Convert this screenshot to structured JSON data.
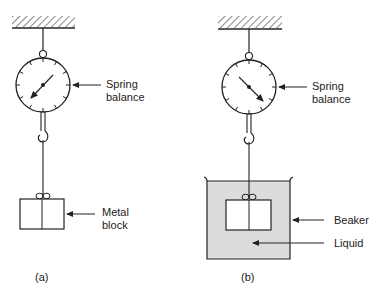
{
  "figure": {
    "panels": [
      {
        "id": "a",
        "caption": "(a)",
        "labels": {
          "balance_line1": "Spring",
          "balance_line2": "balance",
          "block_line1": "Metal",
          "block_line2": "block"
        }
      },
      {
        "id": "b",
        "caption": "(b)",
        "labels": {
          "balance_line1": "Spring",
          "balance_line2": "balance",
          "beaker": "Beaker",
          "liquid": "Liquid"
        }
      }
    ],
    "colors": {
      "line": "#222222",
      "liquid_fill": "#dcdcdc"
    }
  }
}
